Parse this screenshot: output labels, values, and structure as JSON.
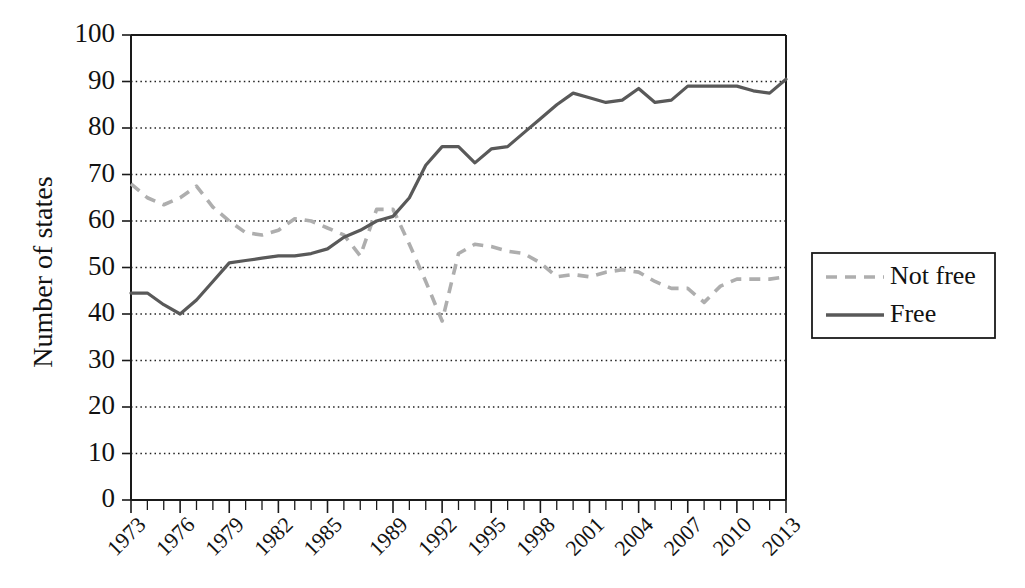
{
  "chart_data": {
    "type": "line",
    "title": "",
    "xlabel": "",
    "ylabel": "Number of states",
    "ylim": [
      0,
      100
    ],
    "ytick_step": 10,
    "ytick_labels": [
      "0",
      "10",
      "20",
      "30",
      "40",
      "50",
      "60",
      "70",
      "80",
      "90",
      "100"
    ],
    "xlim": [
      1973,
      2013
    ],
    "xtick_labels": [
      "1973",
      "1976",
      "1979",
      "1982",
      "1985",
      "1989",
      "1992",
      "1995",
      "1998",
      "2001",
      "2004",
      "2007",
      "2010",
      "2013"
    ],
    "xtick_values": [
      1973,
      1976,
      1979,
      1982,
      1985,
      1989,
      1992,
      1995,
      1998,
      2001,
      2004,
      2007,
      2010,
      2013
    ],
    "grid": "horizontal-dotted",
    "legend_position": "right-outside",
    "x": [
      1973,
      1974,
      1975,
      1976,
      1977,
      1978,
      1979,
      1980,
      1981,
      1982,
      1983,
      1984,
      1985,
      1986,
      1987,
      1988,
      1989,
      1990,
      1991,
      1992,
      1993,
      1994,
      1995,
      1996,
      1997,
      1998,
      1999,
      2000,
      2001,
      2002,
      2003,
      2004,
      2005,
      2006,
      2007,
      2008,
      2009,
      2010,
      2011,
      2012,
      2013
    ],
    "series": [
      {
        "name": "Not free",
        "color": "#aeaeae",
        "style": "dashed",
        "values": [
          68,
          65,
          63.5,
          65,
          67.5,
          63,
          60,
          57.5,
          57,
          58,
          60.5,
          60,
          58.5,
          57,
          52.5,
          62.5,
          62.5,
          55,
          47,
          38.5,
          53,
          55,
          54.5,
          53.5,
          53,
          51,
          48,
          48.5,
          48,
          49,
          49.5,
          49,
          47,
          45.5,
          45.5,
          42.5,
          46,
          47.5,
          47.5,
          47.5,
          48
        ]
      },
      {
        "name": "Free",
        "color": "#595959",
        "style": "solid",
        "values": [
          44.5,
          44.5,
          42,
          40,
          43,
          47,
          51,
          51.5,
          52,
          52.5,
          52.5,
          53,
          54,
          56.5,
          58,
          60,
          61,
          65,
          72,
          76,
          76,
          72.5,
          75.5,
          76,
          79,
          82,
          85,
          87.5,
          86.5,
          85.5,
          86,
          88.5,
          85.5,
          86,
          89,
          89,
          89,
          89,
          88,
          87.5,
          90.5
        ]
      }
    ]
  },
  "legend": {
    "items": [
      {
        "label": "Not free"
      },
      {
        "label": "Free"
      }
    ]
  },
  "axes": {
    "y_title": "Number of states"
  }
}
